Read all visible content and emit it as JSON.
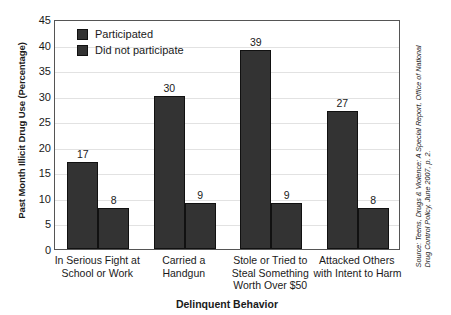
{
  "chart_data": {
    "type": "bar",
    "title": "",
    "xlabel": "Delinquent Behavior",
    "ylabel": "Past Month Illicit Drug Use (Percentage)",
    "ylim": [
      0,
      45
    ],
    "ytick_step": 5,
    "yticks": [
      "45",
      "40",
      "35",
      "30",
      "25",
      "20",
      "15",
      "10",
      "5",
      "0"
    ],
    "grid": true,
    "legend_position": "upper-left-inside",
    "categories": [
      [
        "In Serious Fight at",
        "School or Work"
      ],
      [
        "Carried a",
        "Handgun"
      ],
      [
        "Stole or Tried to",
        "Steal Something",
        "Worth Over $50"
      ],
      [
        "Attacked Others",
        "with Intent to Harm"
      ]
    ],
    "series": [
      {
        "name": "Participated",
        "values": [
          17,
          30,
          39,
          27
        ],
        "color": "#333333"
      },
      {
        "name": "Did not participate",
        "values": [
          8,
          9,
          9,
          8
        ],
        "color": "#333333"
      }
    ]
  },
  "source_note": {
    "line1": "Source: Teens, Drugs & Violence: A Special Report, Office of National",
    "line2": "Drug Control Policy, June 2007, p. 2."
  }
}
